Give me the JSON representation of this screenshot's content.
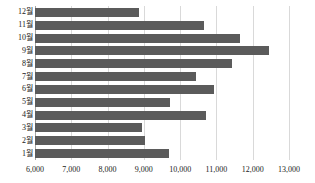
{
  "chart_data": {
    "type": "bar",
    "orientation": "horizontal",
    "title": "",
    "subtitle": "",
    "xlabel": "",
    "ylabel": "",
    "grid": true,
    "legend": false,
    "xlim": [
      6000,
      13000
    ],
    "xticks": [
      6000,
      7000,
      8000,
      9000,
      10000,
      11000,
      12000,
      13000
    ],
    "xtick_labels": [
      "6,000",
      "7,000",
      "8,000",
      "9,000",
      "10,000",
      "11,000",
      "12,000",
      "13,000"
    ],
    "categories": [
      "1월",
      "2월",
      "3월",
      "4월",
      "5월",
      "6월",
      "7월",
      "8월",
      "9월",
      "10월",
      "11월",
      "12월"
    ],
    "category_order_top_to_bottom": [
      "12월",
      "11월",
      "10월",
      "9월",
      "8월",
      "7월",
      "6월",
      "5월",
      "4월",
      "3월",
      "2월",
      "1월"
    ],
    "values": [
      9680,
      9030,
      8950,
      10700,
      9720,
      10940,
      10430,
      11440,
      12440,
      11640,
      10670,
      8870
    ],
    "bars": [
      {
        "category": "12월",
        "value": 8870
      },
      {
        "category": "11월",
        "value": 10670
      },
      {
        "category": "10월",
        "value": 11640
      },
      {
        "category": "9월",
        "value": 12440
      },
      {
        "category": "8월",
        "value": 11440
      },
      {
        "category": "7월",
        "value": 10430
      },
      {
        "category": "6월",
        "value": 10940
      },
      {
        "category": "5월",
        "value": 9720
      },
      {
        "category": "4월",
        "value": 10700
      },
      {
        "category": "3월",
        "value": 8950
      },
      {
        "category": "2월",
        "value": 9030
      },
      {
        "category": "1월",
        "value": 9680
      }
    ],
    "bar_color": "#5b5b5b",
    "grid_color": "#d9d9d9",
    "axis_color": "#a6a6a6",
    "background_color": "#ffffff"
  }
}
